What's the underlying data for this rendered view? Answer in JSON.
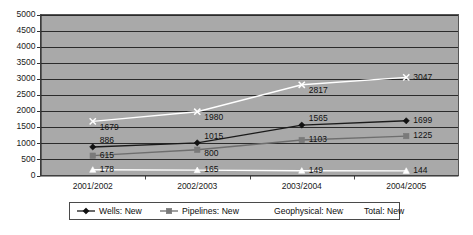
{
  "chart_data": {
    "type": "line",
    "title": "",
    "subtitle": "",
    "xlabel": "",
    "ylabel": "",
    "categories": [
      "2001/2002",
      "2002/2003",
      "2003/2004",
      "2004/2005"
    ],
    "ylim": [
      0,
      5000
    ],
    "yticks": [
      0,
      500,
      1000,
      1500,
      2000,
      2500,
      3000,
      3500,
      4000,
      4500,
      5000
    ],
    "ytick_labels": [
      "0",
      "500",
      "1000",
      "1500",
      "2000",
      "2500",
      "3000",
      "3500",
      "4000",
      "4500",
      "5000"
    ],
    "grid": true,
    "grid_axis": "y",
    "legend_position": "bottom",
    "plot_background": "#a9a9a9",
    "figure_background": "#ffffff",
    "series": [
      {
        "name": "Wells: New",
        "color": "#1a1a1a",
        "marker": "diamond",
        "marker_color": "#111111",
        "values": [
          886,
          1015,
          1565,
          1699
        ],
        "labels": [
          "886",
          "1015",
          "1565",
          "1699"
        ]
      },
      {
        "name": "Pipelines: New",
        "color": "#6e6e6e",
        "marker": "square",
        "marker_color": "#7a7a7a",
        "values": [
          615,
          800,
          1103,
          1225
        ],
        "labels": [
          "615",
          "800",
          "1103",
          "1225"
        ]
      },
      {
        "name": "Geophysical: New",
        "color": "#ffffff",
        "marker": "triangle",
        "marker_color": "#ffffff",
        "values": [
          178,
          165,
          149,
          144
        ],
        "labels": [
          "178",
          "165",
          "149",
          "144"
        ]
      },
      {
        "name": "Total: New",
        "color": "#ffffff",
        "marker": "cross",
        "marker_color": "#ffffff",
        "values": [
          1679,
          1980,
          2817,
          3047
        ],
        "labels": [
          "1679",
          "1980",
          "2817",
          "3047"
        ]
      }
    ]
  },
  "legend": {
    "items": [
      {
        "label": "Wells: New"
      },
      {
        "label": "Pipelines: New"
      },
      {
        "label": "Geophysical: New"
      },
      {
        "label": "Total: New"
      }
    ]
  }
}
